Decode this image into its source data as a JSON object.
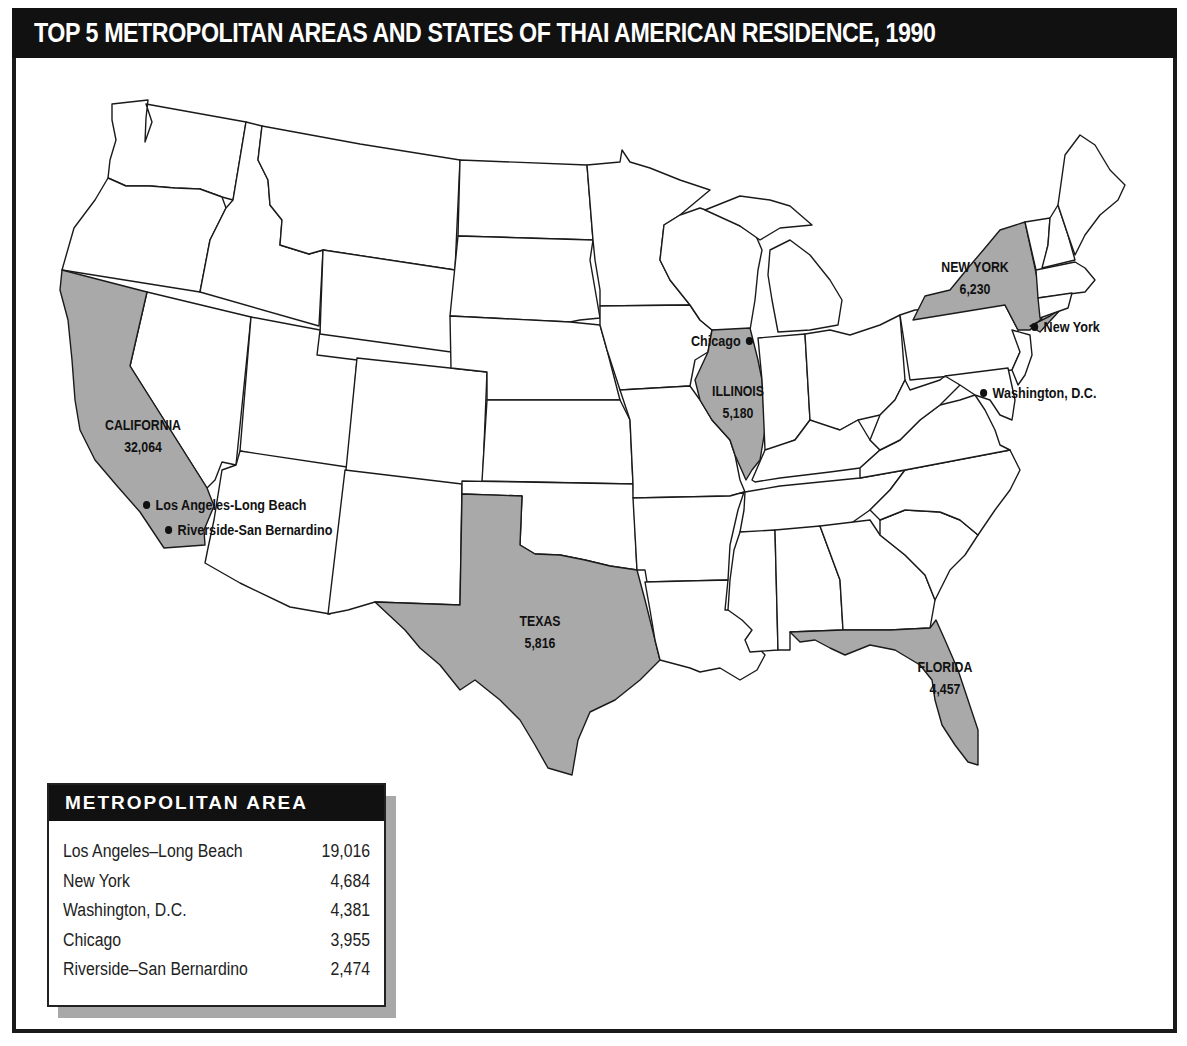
{
  "title": "TOP 5 METROPOLITAN AREAS AND STATES OF THAI AMERICAN RESIDENCE, 1990",
  "colors": {
    "highlight_state": "#a9a9a9",
    "border": "#1a1a1a",
    "title_bg": "#111111"
  },
  "states": [
    {
      "name": "CALIFORNIA",
      "value": "32,064"
    },
    {
      "name": "NEW YORK",
      "value": "6,230"
    },
    {
      "name": "TEXAS",
      "value": "5,816"
    },
    {
      "name": "ILLINOIS",
      "value": "5,180"
    },
    {
      "name": "FLORIDA",
      "value": "4,457"
    }
  ],
  "cities": [
    {
      "name": "Los Angeles-Long Beach"
    },
    {
      "name": "Riverside-San Bernardino"
    },
    {
      "name": "Chicago"
    },
    {
      "name": "New York"
    },
    {
      "name": "Washington, D.C."
    }
  ],
  "legend": {
    "title": "METROPOLITAN AREA",
    "rows": [
      {
        "name": "Los Angeles–Long Beach",
        "value": "19,016"
      },
      {
        "name": "New York",
        "value": "4,684"
      },
      {
        "name": "Washington, D.C.",
        "value": "4,381"
      },
      {
        "name": "Chicago",
        "value": "3,955"
      },
      {
        "name": "Riverside–San Bernardino",
        "value": "2,474"
      }
    ]
  }
}
